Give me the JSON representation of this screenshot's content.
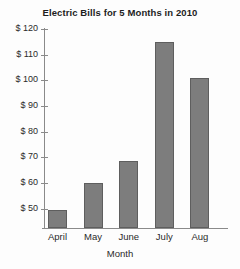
{
  "chart_data": {
    "type": "bar",
    "title": "Electric Bills for 5 Months in 2010",
    "xlabel": "Month",
    "ylabel": "",
    "categories": [
      "April",
      "May",
      "June",
      "July",
      "Aug"
    ],
    "values": [
      49.5,
      60,
      68.5,
      115,
      101
    ],
    "ylim": [
      42.5,
      120
    ],
    "ytick_values": [
      120,
      110,
      100,
      90,
      80,
      70,
      60,
      50
    ],
    "ytick_labels": [
      "$ 120",
      "$ 110",
      "$ 100",
      "$ 90",
      "$ 80",
      "$ 70",
      "$ 60",
      "$ 50"
    ],
    "grid": false,
    "legend": null,
    "series": [
      {
        "name": "Electric Bill",
        "values": [
          49.5,
          60,
          68.5,
          115,
          101
        ]
      }
    ],
    "colors": {
      "bar_fill": "#7d7d7d",
      "bar_border": "#5e5e5e",
      "axis": "#8a8a8a",
      "text": "#2a2a2a",
      "title": "#1d1d1d",
      "background": "#fdfdfd"
    }
  }
}
